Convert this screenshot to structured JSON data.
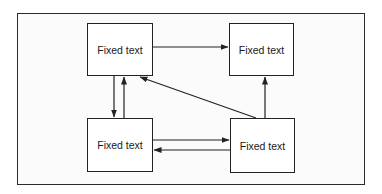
{
  "diagram": {
    "type": "block-flow",
    "nodes": [
      {
        "id": "tl",
        "label": "Fixed text",
        "x": 87,
        "y": 23,
        "w": 66,
        "h": 53
      },
      {
        "id": "tr",
        "label": "Fixed text",
        "x": 229,
        "y": 23,
        "w": 65,
        "h": 53
      },
      {
        "id": "bl",
        "label": "Fixed text",
        "x": 87,
        "y": 118,
        "w": 66,
        "h": 54
      },
      {
        "id": "br",
        "label": "Fixed text",
        "x": 230,
        "y": 118,
        "w": 65,
        "h": 55
      }
    ],
    "edges": [
      {
        "from": "tl",
        "to": "tr",
        "direction": "right"
      },
      {
        "from": "tl",
        "to": "bl",
        "direction": "down"
      },
      {
        "from": "bl",
        "to": "tl",
        "direction": "up"
      },
      {
        "from": "br",
        "to": "tl",
        "direction": "diagonal-up-left"
      },
      {
        "from": "br",
        "to": "tr",
        "direction": "up"
      },
      {
        "from": "bl",
        "to": "br",
        "direction": "right"
      },
      {
        "from": "br",
        "to": "bl",
        "direction": "left"
      }
    ],
    "colors": {
      "stroke": "#222222",
      "background": "#ffffff"
    }
  }
}
